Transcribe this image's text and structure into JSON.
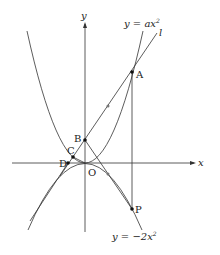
{
  "diagram": {
    "axes": {
      "x_label": "x",
      "y_label": "y",
      "origin_label": "O"
    },
    "curves": {
      "upper": {
        "label": "y = ax²",
        "label_parts": [
          "y = ax",
          "2"
        ]
      },
      "lower": {
        "label": "y = −2x²",
        "label_parts": [
          "y = −2x",
          "2"
        ]
      },
      "line": {
        "label": "l"
      }
    },
    "points": [
      {
        "name": "A"
      },
      {
        "name": "B"
      },
      {
        "name": "C"
      },
      {
        "name": "D"
      },
      {
        "name": "P"
      }
    ],
    "colors": {
      "stroke": "#222222",
      "background": "#ffffff"
    }
  }
}
